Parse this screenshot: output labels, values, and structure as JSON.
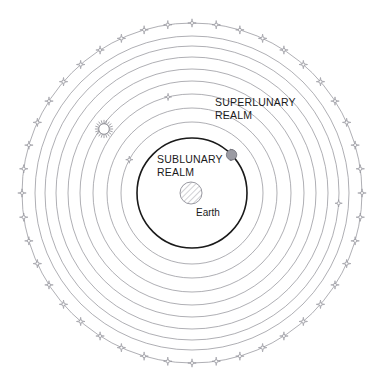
{
  "diagram": {
    "title_visible": false,
    "center": {
      "x": 192,
      "y": 193
    },
    "background_color": "#ffffff",
    "labels": {
      "superlunary_line1": "SUPERLUNARY",
      "superlunary_line2": "REALM",
      "sublunary_line1": "SUBLUNARY",
      "sublunary_line2": "REALM",
      "earth": "Earth"
    },
    "colors": {
      "sphere_stroke": "#8c8c93",
      "sublunary_stroke": "#1a1a1a",
      "star_stroke": "#8c8c93",
      "earth_stroke": "#8c8c93",
      "earth_hatch": "#9a9aa2",
      "moon_fill": "#9b9ba3",
      "moon_stroke": "#6f6f77",
      "sun_stroke": "#8c8c93",
      "text": "#1a1a1a"
    },
    "earth": {
      "name": "Earth",
      "radius": 11,
      "fill_pattern": "diagonal-hatch"
    },
    "sublunary_sphere": {
      "name": "sublunary-realm-boundary",
      "radius": 55,
      "stroke_width": 1.6
    },
    "superlunary_spheres": [
      {
        "name": "sphere-1",
        "radius": 71
      },
      {
        "name": "sphere-2",
        "radius": 85
      },
      {
        "name": "sphere-3",
        "radius": 99
      },
      {
        "name": "sphere-4",
        "radius": 112
      },
      {
        "name": "sphere-5",
        "radius": 124
      },
      {
        "name": "sphere-6",
        "radius": 136
      },
      {
        "name": "sphere-7",
        "radius": 147
      },
      {
        "name": "sphere-8",
        "radius": 157
      }
    ],
    "fixed_star_sphere": {
      "name": "sphere-of-fixed-stars",
      "radius": 170,
      "star_count": 44
    },
    "moon_marker": {
      "name": "moon",
      "angle_deg": -44,
      "radius_on_sphere": 55,
      "size": 5.5
    },
    "sun_marker": {
      "name": "sun",
      "x": 104,
      "y": 129,
      "radius": 6.5,
      "ray_count": 20
    },
    "planet_markers": [
      {
        "name": "planet-marker-1",
        "sphere_radius": 71,
        "angle_deg": 208
      },
      {
        "name": "planet-marker-2",
        "sphere_radius": 99,
        "angle_deg": 256
      },
      {
        "name": "planet-marker-3",
        "sphere_radius": 147,
        "angle_deg": 4
      }
    ],
    "label_positions": {
      "superlunary": {
        "x": 215,
        "y": 106
      },
      "sublunary": {
        "x": 157,
        "y": 163
      },
      "earth": {
        "x": 196,
        "y": 216
      }
    }
  }
}
